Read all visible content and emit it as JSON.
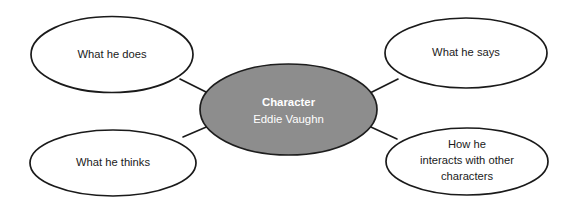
{
  "diagram": {
    "type": "mind-map",
    "title_visible": false,
    "background_color": "#ffffff",
    "center_fill_color": "#8d8d8d",
    "center_text_color": "#ffffff",
    "node_fill_color": "#ffffff",
    "node_stroke_color": "#1a1a1a",
    "center": {
      "label": "Character",
      "sublabel": "Eddie Vaughn"
    },
    "branches": [
      {
        "label": "What he does",
        "lines": [
          "What he does"
        ],
        "position": "top-left"
      },
      {
        "label": "What he says",
        "lines": [
          "What he says"
        ],
        "position": "top-right"
      },
      {
        "label": "What he thinks",
        "lines": [
          "What he thinks"
        ],
        "position": "bottom-left"
      },
      {
        "label": "How he interacts with other characters",
        "lines": [
          "How he",
          "interacts with other",
          "characters"
        ],
        "position": "bottom-right"
      }
    ]
  }
}
